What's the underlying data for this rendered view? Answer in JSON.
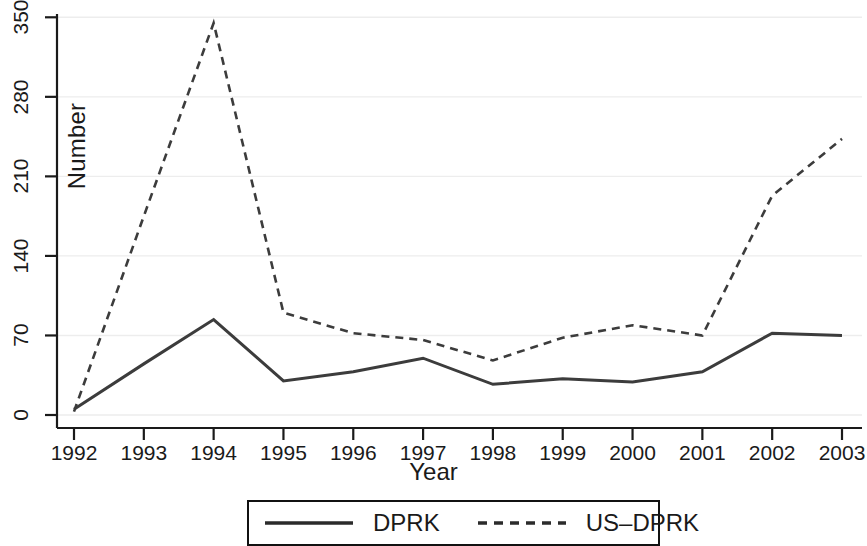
{
  "chart_data": {
    "type": "line",
    "title": "",
    "xlabel": "Year",
    "ylabel": "Number",
    "categories": [
      "1992",
      "1993",
      "1994",
      "1995",
      "1996",
      "1997",
      "1998",
      "1999",
      "2000",
      "2001",
      "2002",
      "2003"
    ],
    "x": [
      1992,
      1993,
      1994,
      1995,
      1996,
      1997,
      1998,
      1999,
      2000,
      2001,
      2002,
      2003
    ],
    "xlim": [
      1992,
      2003
    ],
    "ylim": [
      0,
      350
    ],
    "yticks": [
      0,
      70,
      140,
      210,
      280,
      350
    ],
    "ytick_labels": [
      "0",
      "70",
      "140",
      "210",
      "280",
      "350"
    ],
    "xticks": [
      1992,
      1993,
      1994,
      1995,
      1996,
      1997,
      1998,
      1999,
      2000,
      2001,
      2002,
      2003
    ],
    "xtick_labels": [
      "1992",
      "1993",
      "1994",
      "1995",
      "1996",
      "1997",
      "1998",
      "1999",
      "2000",
      "2001",
      "2002",
      "2003"
    ],
    "grid": true,
    "grid_axis": "y",
    "legend_position": "below",
    "series": [
      {
        "name": "DPRK",
        "style": "solid",
        "color": "#3c3c3c",
        "values": [
          5,
          45,
          84,
          30,
          38,
          50,
          27,
          32,
          29,
          38,
          72,
          70
        ]
      },
      {
        "name": "US-DPRK",
        "style": "dashed",
        "color": "#3c3c3c",
        "values": [
          3,
          175,
          345,
          90,
          72,
          66,
          48,
          68,
          79,
          70,
          193,
          243
        ]
      }
    ]
  },
  "legend": {
    "items": [
      {
        "label": "DPRK",
        "style": "solid"
      },
      {
        "label": "US–DPRK",
        "style": "dashed"
      }
    ]
  },
  "axes": {
    "y_title": "Number",
    "x_title": "Year"
  },
  "colors": {
    "line": "#3c3c3c",
    "axis": "#1a1a1a",
    "grid": "#ededed",
    "background": "#ffffff"
  }
}
